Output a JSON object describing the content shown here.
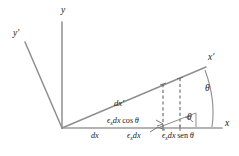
{
  "figure": {
    "type": "geometry-diagram",
    "colors": {
      "axis": "#8a8a8a",
      "line": "#9a9a9a",
      "dashed": "#6e6e6e",
      "text": "#1a1a1a",
      "background": "#ffffff"
    },
    "axes": [
      {
        "id": "y",
        "label": "y",
        "prime": "",
        "x": 61,
        "y": 12
      },
      {
        "id": "y-prime",
        "label": "y",
        "prime": "'",
        "x": 13,
        "y": 33
      },
      {
        "id": "x",
        "label": "x",
        "prime": "",
        "x": 225,
        "y": 121
      },
      {
        "id": "x-prime",
        "label": "x",
        "prime": "'",
        "x": 209,
        "y": 57
      }
    ],
    "angles": [
      {
        "id": "theta-outer",
        "label": "θ",
        "x": 205,
        "y": 87
      },
      {
        "id": "theta-inner",
        "label": "θ",
        "x": 187,
        "y": 116
      }
    ],
    "segments": [
      {
        "id": "dx-prime",
        "label": "dx",
        "prime": "'",
        "x": 115,
        "y": 101
      }
    ],
    "terms": [
      {
        "id": "eps-dx-cos-theta",
        "epsilon": "ϵ",
        "subscript": "x",
        "body": "dx",
        "func": "cos",
        "angle": "θ",
        "x": 108,
        "y": 118
      },
      {
        "id": "dx",
        "epsilon": "",
        "subscript": "",
        "body": "dx",
        "func": "",
        "angle": "",
        "x": 91,
        "y": 133
      },
      {
        "id": "eps-dx",
        "epsilon": "ϵ",
        "subscript": "x",
        "body": "dx",
        "func": "",
        "angle": "",
        "x": 127,
        "y": 133
      },
      {
        "id": "eps-dx-sen-theta",
        "epsilon": "ϵ",
        "subscript": "x",
        "body": "dx",
        "func": "sen",
        "angle": "θ",
        "x": 163,
        "y": 133
      }
    ],
    "geometry": {
      "origin": {
        "x": 62,
        "y": 128
      },
      "y_axis_tip": {
        "x": 62,
        "y": 22
      },
      "y_prime_tip": {
        "x": 25,
        "y": 42
      },
      "x_axis_tip": {
        "x": 222,
        "y": 128
      },
      "x_prime_tip": {
        "x": 206,
        "y": 67
      },
      "dashed_lines": [
        {
          "x": 163,
          "y_top": 84,
          "y_bottom": 128
        },
        {
          "x": 180,
          "y_top": 79,
          "y_bottom": 128
        }
      ]
    }
  }
}
